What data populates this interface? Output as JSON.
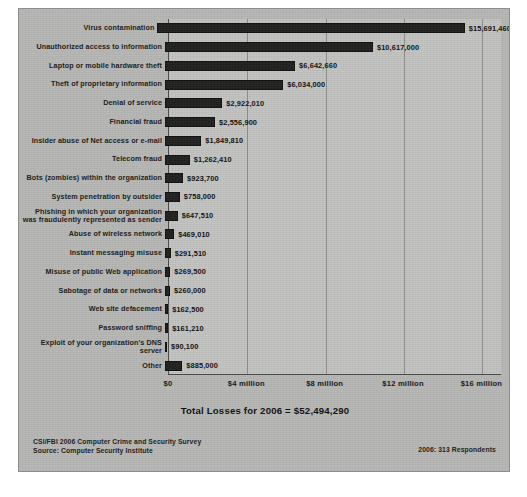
{
  "chart_data": {
    "type": "bar",
    "orientation": "horizontal",
    "title": "",
    "xlabel": "",
    "ylabel": "",
    "xlim": [
      0,
      17000000
    ],
    "grid": true,
    "legend": "none",
    "tick_labels": [
      "$0",
      "$4 million",
      "$8 million",
      "$12 million",
      "$16 million"
    ],
    "tick_values": [
      0,
      4000000,
      8000000,
      12000000,
      16000000
    ],
    "categories": [
      "Virus contamination",
      "Unauthorized access to information",
      "Laptop or mobile hardware theft",
      "Theft of proprietary information",
      "Denial of service",
      "Financial fraud",
      "Insider abuse of Net access or e-mail",
      "Telecom fraud",
      "Bots (zombies) within the organization",
      "System penetration by outsider",
      "Phishing in which your organization\nwas fraudulently represented as sender",
      "Abuse of wireless network",
      "Instant messaging misuse",
      "Misuse of public Web application",
      "Sabotage of data or networks",
      "Web site defacement",
      "Password sniffing",
      "Exploit of your organization's DNS server",
      "Other"
    ],
    "values": [
      15691460,
      10617000,
      6642660,
      6034000,
      2922010,
      2556900,
      1849810,
      1262410,
      923700,
      758000,
      647510,
      469010,
      291510,
      269500,
      260000,
      162500,
      161210,
      90100,
      885000
    ],
    "value_labels": [
      "$15,691,460",
      "$10,617,000",
      "$6,642,660",
      "$6,034,000",
      "$2,922,010",
      "$2,556,900",
      "$1,849,810",
      "$1,262,410",
      "$923,700",
      "$758,000",
      "$647,510",
      "$469,010",
      "$291,510",
      "$269,500",
      "$260,000",
      "$162,500",
      "$161,210",
      "$90,100",
      "$885,000"
    ],
    "annotations": {
      "total": "Total Losses for 2006 = $52,494,290"
    },
    "bar_color": "#20201e",
    "plot_background": "#c2c2c0",
    "panel_background": "#b6b6b4"
  },
  "footer": {
    "survey_line1": "CSI/FBI 2006 Computer Crime and Security Survey",
    "survey_line2": "Source: Computer Security Institute",
    "respondents": "2006: 313 Respondents"
  }
}
